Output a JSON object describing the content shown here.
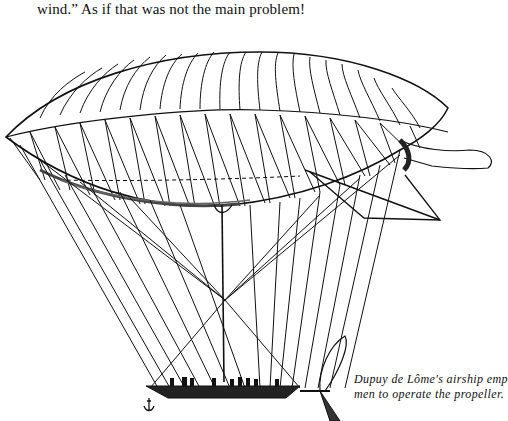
{
  "page": {
    "body_text": "wind.” As if that was not the main problem!",
    "figure": {
      "subject": "airship-illustration",
      "caption_lines": [
        "Dupuy de Lôme's airship emp",
        "men to operate the propeller."
      ]
    },
    "colors": {
      "ink": "#111111",
      "paper": "#ffffff"
    }
  }
}
